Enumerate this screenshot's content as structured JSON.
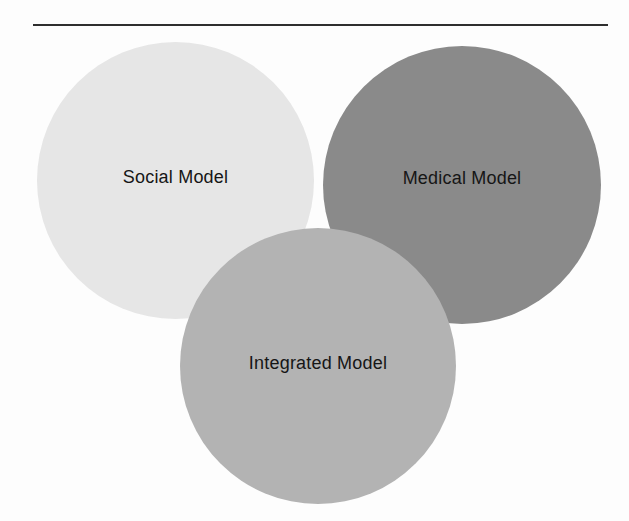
{
  "page": {
    "background": "#fdfdfd"
  },
  "divider": {
    "color": "#2e2e2e"
  },
  "diagram": {
    "text_color": "#161616",
    "circles": [
      {
        "id": "social",
        "label": "Social Model",
        "color": "#e6e6e6"
      },
      {
        "id": "medical",
        "label": "Medical Model",
        "color": "#8a8a8a"
      },
      {
        "id": "integrated",
        "label": "Integrated Model",
        "color": "#b3b3b3"
      }
    ]
  }
}
